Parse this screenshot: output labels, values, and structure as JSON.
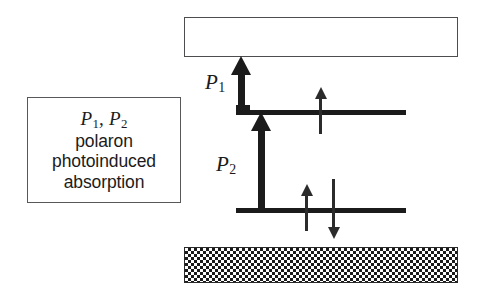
{
  "figure": {
    "kind": "energy-level-transition-diagram",
    "background_color": "#ffffff",
    "line_color": "#1b1b1b",
    "box_border_color": "#58585a"
  },
  "legend": {
    "symbols_prefix": "P",
    "symbol_1_sub": "1",
    "symbol_2_prefix": ", P",
    "symbol_2_sub": "2",
    "lines": [
      "polaron",
      "photoinduced",
      "absorption"
    ]
  },
  "bands": {
    "upper_band_label": "",
    "lower_band_label": "",
    "upper_band_fill": "open",
    "lower_band_fill": "checkerboard"
  },
  "levels": [
    {
      "name": "upper-polaron-level",
      "label": ""
    },
    {
      "name": "lower-polaron-level",
      "label": ""
    }
  ],
  "transitions": [
    {
      "name": "P1",
      "symbol": "P",
      "subscript": "1",
      "direction": "up",
      "from": "upper-polaron-level",
      "to": "upper-band"
    },
    {
      "name": "P2",
      "symbol": "P",
      "subscript": "2",
      "direction": "up",
      "from": "lower-polaron-level",
      "to": "upper-polaron-level"
    }
  ],
  "spins": [
    {
      "name": "upper-level-spin-up",
      "direction": "up",
      "level": "upper-polaron-level"
    },
    {
      "name": "lower-level-spin-up",
      "direction": "up",
      "level": "lower-polaron-level"
    },
    {
      "name": "lower-level-spin-down",
      "direction": "down",
      "level": "lower-polaron-level"
    }
  ]
}
